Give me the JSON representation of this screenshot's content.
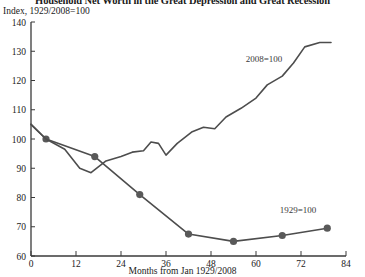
{
  "title": "Household Net Worth in the Great Depression and Great Recession",
  "subtitle": "Index, 1929/2008=100",
  "xlabel": "Months from Jan 1929/2008",
  "chart_data": {
    "type": "line",
    "title": "Household Net Worth in the Great Depression and Great Recession",
    "subtitle": "Index, 1929/2008=100",
    "xlabel": "Months from Jan 1929/2008",
    "ylabel": "Index, 1929/2008=100",
    "xlim": [
      0,
      84
    ],
    "ylim": [
      60,
      140
    ],
    "xticks": [
      0,
      12,
      24,
      36,
      48,
      60,
      72,
      84
    ],
    "yticks": [
      60,
      70,
      80,
      90,
      100,
      110,
      120,
      130,
      140
    ],
    "grid": false,
    "legend_position": "inline-annotation",
    "line_color": "#4d4d4d",
    "marker_color": "#595959",
    "series": [
      {
        "name": "1929=100",
        "annotation": "1929=100",
        "markers": true,
        "x": [
          0,
          4,
          17,
          29,
          42,
          54,
          67,
          79
        ],
        "values": [
          105,
          100,
          94,
          81,
          67.5,
          65,
          67,
          69.5
        ]
      },
      {
        "name": "2008=100",
        "annotation": "2008=100",
        "markers": false,
        "x": [
          0,
          4,
          9,
          13,
          16,
          20,
          24,
          27,
          30,
          32,
          34,
          36,
          39,
          43,
          46,
          49,
          52,
          56,
          60,
          63,
          67,
          70,
          73,
          77,
          80
        ],
        "values": [
          105,
          100,
          96.5,
          90,
          88.5,
          92.5,
          94,
          95.5,
          96,
          99,
          98.5,
          94.5,
          98.5,
          102.5,
          104,
          103.5,
          107.5,
          110.5,
          114,
          118.5,
          121.5,
          126,
          131.5,
          133,
          133
        ]
      }
    ]
  }
}
